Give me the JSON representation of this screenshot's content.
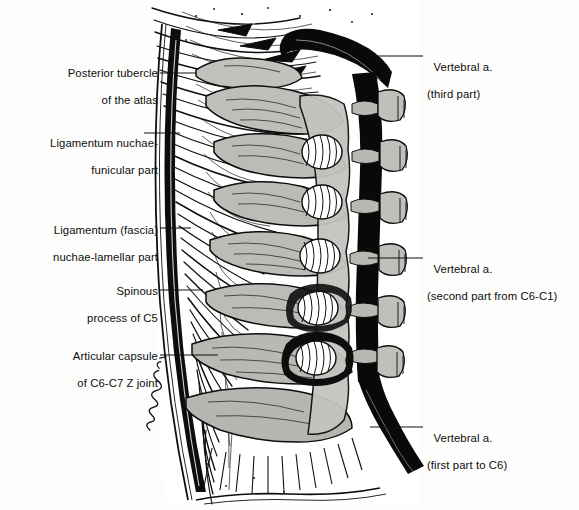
{
  "figure": {
    "colors": {
      "ink": "#0d0d0d",
      "bone_gray": "#b9b9b4",
      "bone_gray_light": "#cdcdc8",
      "bone_gray_dark": "#9a9a94",
      "artery_black": "#0a0a0a",
      "paper": "#fdfdfc",
      "leader": "#111111"
    },
    "signature": "J. Cummings '94"
  },
  "labels_left": [
    {
      "name": "posterior-tubercle-of-the-atlas",
      "line1": "Posterior tubercle",
      "line2": "of the atlas",
      "text_x": 12,
      "text_y": 54,
      "text_w": 146,
      "leader": {
        "x1": 160,
        "y1": 73,
        "x2": 196,
        "y2": 73
      }
    },
    {
      "name": "ligamentum-nuchae-funicular-part",
      "line1": "Ligamentum nuchae-",
      "line2": "funicular part",
      "text_x": 12,
      "text_y": 124,
      "text_w": 146,
      "leader": {
        "x1": 144,
        "y1": 133,
        "x2": 180,
        "y2": 133
      }
    },
    {
      "name": "ligamentum-fascia-nuchae-lamellar-part",
      "line1": "Ligamentum (fascia)",
      "line2": "nuchae-lamellar part",
      "text_x": 12,
      "text_y": 211,
      "text_w": 146,
      "leader": {
        "x1": 160,
        "y1": 228,
        "x2": 191,
        "y2": 228
      }
    },
    {
      "name": "spinous-process-of-c5",
      "line1": "Spinous",
      "line2": "process of C5",
      "text_x": 12,
      "text_y": 272,
      "text_w": 146,
      "leader": {
        "x1": 160,
        "y1": 290,
        "x2": 203,
        "y2": 290
      }
    },
    {
      "name": "articular-capsule-of-c6-c7-z-joint",
      "line1": "Articular capsule",
      "line2": "of C6-C7 Z joint",
      "text_x": 12,
      "text_y": 337,
      "text_w": 146,
      "leader": {
        "x1": 160,
        "y1": 355,
        "x2": 218,
        "y2": 355
      }
    }
  ],
  "labels_right": [
    {
      "name": "vertebral-artery-third-part",
      "line1": "Vertebral a.",
      "line2": "(third part)",
      "text_x": 427,
      "text_y": 48,
      "leader": {
        "x1": 378,
        "y1": 56,
        "x2": 423,
        "y2": 56
      }
    },
    {
      "name": "vertebral-artery-second-part",
      "line1": "Vertebral a.",
      "line2": "(second part from C6-C1)",
      "text_x": 427,
      "text_y": 250,
      "leader": {
        "x1": 368,
        "y1": 258,
        "x2": 423,
        "y2": 258
      }
    },
    {
      "name": "vertebral-artery-first-part",
      "line1": "Vertebral a.",
      "line2": "(first part to C6)",
      "text_x": 427,
      "text_y": 419,
      "leader": {
        "x1": 370,
        "y1": 427,
        "x2": 423,
        "y2": 427
      }
    }
  ]
}
